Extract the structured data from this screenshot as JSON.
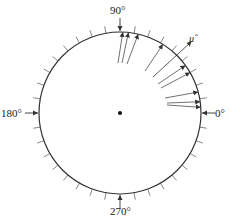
{
  "diagram": {
    "type": "circular-data-plot",
    "center": [
      120,
      113
    ],
    "radius": 81,
    "tick_interval_deg": 10,
    "tick_length": 7,
    "colors": {
      "stroke": "#333333",
      "background": "#ffffff"
    },
    "axis_labels": {
      "deg0": "0°",
      "deg90": "90°",
      "deg180": "180°",
      "deg270": "270°"
    },
    "mean_direction_label": "μ̂",
    "mean_direction_deg": 45,
    "vectors": [
      {
        "tip_deg": 88,
        "tail": [
          118,
          63
        ]
      },
      {
        "tip_deg": 84,
        "tail": [
          122,
          63
        ]
      },
      {
        "tip_deg": 77,
        "tail": [
          127,
          64
        ]
      },
      {
        "tip_deg": 58,
        "tail": [
          145,
          71
        ]
      },
      {
        "tip_deg": 36,
        "tail": [
          158,
          84
        ]
      },
      {
        "tip_deg": 30,
        "tail": [
          161,
          88
        ]
      },
      {
        "tip_deg": 15,
        "tail": [
          165,
          98
        ]
      },
      {
        "tip_deg": 8,
        "tail": [
          167,
          103
        ]
      },
      {
        "tip_deg": 4,
        "tail": [
          167,
          105
        ]
      }
    ],
    "mean_vector": {
      "tail": [
        153,
        77
      ],
      "length_factor": 1.25
    }
  }
}
